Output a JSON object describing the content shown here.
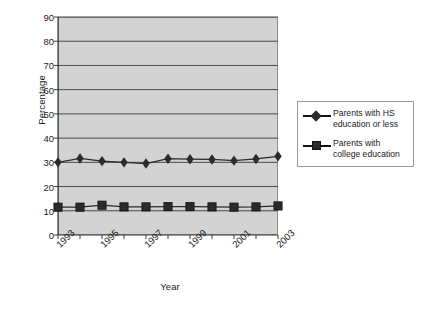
{
  "chart_data": {
    "type": "line",
    "title": "",
    "xlabel": "Year",
    "ylabel": "Percentage",
    "x": [
      1993,
      1994,
      1995,
      1996,
      1997,
      1998,
      1999,
      2000,
      2001,
      2002,
      2003
    ],
    "xtick_labels": [
      "1993",
      "1995",
      "1997",
      "1999",
      "2001",
      "2003"
    ],
    "xtick_values": [
      1993,
      1995,
      1997,
      1999,
      2001,
      2003
    ],
    "ytick_labels": [
      "0",
      "10",
      "20",
      "30",
      "40",
      "50",
      "60",
      "70",
      "80",
      "90"
    ],
    "ytick_values": [
      0,
      10,
      20,
      30,
      40,
      50,
      60,
      70,
      80,
      90
    ],
    "ylim": [
      0,
      90
    ],
    "xlim": [
      1993,
      2003
    ],
    "grid": "horizontal",
    "legend_position": "right",
    "plot_background": "#d3d3d3",
    "series": [
      {
        "name": "Parents with HS education or less",
        "marker": "diamond",
        "color": "#2b2b2b",
        "values": [
          30.0,
          31.6,
          30.5,
          30.0,
          29.5,
          31.5,
          31.3,
          31.2,
          30.7,
          31.4,
          32.5
        ]
      },
      {
        "name": "Parents with college education",
        "marker": "square",
        "color": "#2b2b2b",
        "values": [
          11.5,
          11.5,
          12.3,
          11.6,
          11.6,
          11.7,
          11.7,
          11.6,
          11.5,
          11.6,
          12.0
        ]
      }
    ]
  },
  "legend": {
    "items": [
      {
        "label_line1": "Parents with HS",
        "label_line2": "education or less",
        "marker": "diamond"
      },
      {
        "label_line1": "Parents with",
        "label_line2": "college education",
        "marker": "square"
      }
    ]
  }
}
